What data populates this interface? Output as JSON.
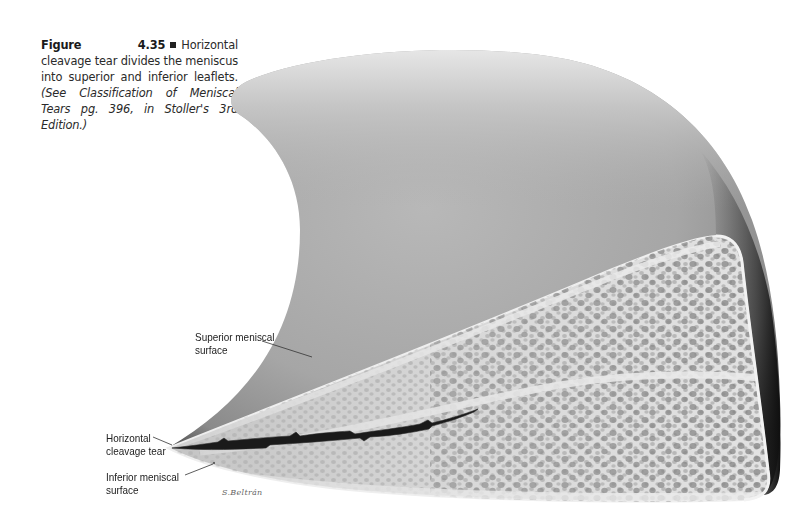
{
  "figure": {
    "number": "Figure 4.35",
    "caption_main": "Horizontal cleavage tear divides the meniscus into superior and inferior leaflets.",
    "caption_ref": "(See Classification of Meniscal Tears pg. 396, in Stoller's 3rd Edition.)"
  },
  "labels": {
    "superior": {
      "line1": "Superior meniscal",
      "line2": "surface"
    },
    "tear": {
      "line1": "Horizontal",
      "line2": "cleavage tear"
    },
    "inferior": {
      "line1": "Inferior meniscal",
      "line2": "surface"
    }
  },
  "signature": "S.Beltrán",
  "colors": {
    "surface_light": "#d4d4d4",
    "surface_mid": "#a9a9a9",
    "surface_dark": "#1e1e1e",
    "cross_section": "#d8d8d8",
    "pores": "#7a7a7a",
    "tear": "#1a1a1a"
  }
}
